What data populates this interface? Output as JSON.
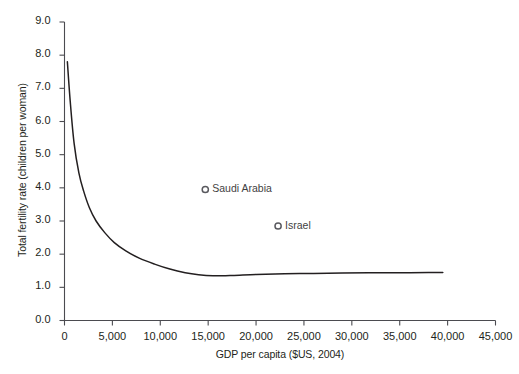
{
  "chart_data": {
    "type": "line",
    "title": "",
    "subtitle": "",
    "xlabel": "GDP per capita ($US, 2004)",
    "ylabel": "Total fertility rate (children per woman)",
    "xlim": [
      0,
      45000
    ],
    "ylim": [
      0.0,
      9.0
    ],
    "grid": false,
    "legend": "none",
    "xticks": [
      0,
      5000,
      10000,
      15000,
      20000,
      25000,
      30000,
      35000,
      40000,
      45000
    ],
    "xtick_labels": [
      "0",
      "5,000",
      "10,000",
      "15,000",
      "20,000",
      "25,000",
      "30,000",
      "35,000",
      "40,000",
      "45,000"
    ],
    "yticks": [
      0.0,
      1.0,
      2.0,
      3.0,
      4.0,
      5.0,
      6.0,
      7.0,
      8.0,
      9.0
    ],
    "ytick_labels": [
      "0.0",
      "1.0",
      "2.0",
      "3.0",
      "4.0",
      "5.0",
      "6.0",
      "7.0",
      "8.0",
      "9.0"
    ],
    "series": [
      {
        "name": "fitted trend",
        "color": "#231f20",
        "x": [
          300,
          600,
          1000,
          1500,
          2000,
          2600,
          3300,
          4200,
          5200,
          6400,
          7800,
          9400,
          11000,
          12600,
          14000,
          15500,
          17500,
          20000,
          23000,
          26000,
          29000,
          32000,
          35000,
          38000,
          39500
        ],
        "values": [
          7.8,
          6.6,
          5.35,
          4.45,
          3.9,
          3.4,
          3.0,
          2.65,
          2.35,
          2.1,
          1.88,
          1.7,
          1.55,
          1.44,
          1.38,
          1.35,
          1.36,
          1.39,
          1.41,
          1.42,
          1.43,
          1.44,
          1.44,
          1.45,
          1.45
        ]
      }
    ],
    "annotations": [
      {
        "label": "Saudi Arabia",
        "x": 14700,
        "y": 3.95,
        "marker": "open-circle"
      },
      {
        "label": "Israel",
        "x": 22300,
        "y": 2.85,
        "marker": "open-circle"
      }
    ]
  },
  "axis_colors": {
    "axis": "#231f20",
    "curve": "#231f20",
    "marker": "#5a5a5f",
    "label_text": "#231f20",
    "annotation_text": "#3f3f42"
  }
}
